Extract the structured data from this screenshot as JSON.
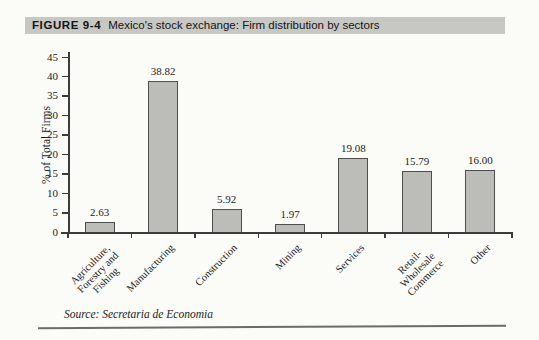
{
  "header": {
    "figure_label": "FIGURE 9-4",
    "title": "Mexico's stock exchange: Firm distribution by sectors"
  },
  "footer": {
    "source": "Source: Secretaria de Economia"
  },
  "chart_data": {
    "type": "bar",
    "title": "Mexico's stock exchange: Firm distribution by sectors",
    "categories": [
      "Agriculture,\nForestry and\nFishing",
      "Manufacturing",
      "Construction",
      "Mining",
      "Services",
      "Retail-\nWholesale\nCommerce",
      "Other"
    ],
    "values": [
      2.63,
      38.82,
      5.92,
      1.97,
      19.08,
      15.79,
      16.0
    ],
    "value_labels": [
      "2.63",
      "38.82",
      "5.92",
      "1.97",
      "19.08",
      "15.79",
      "16.00"
    ],
    "xlabel": "",
    "ylabel": "% of Total Firms",
    "ylim": [
      0,
      45
    ],
    "yticks": [
      0,
      5,
      10,
      15,
      20,
      25,
      30,
      35,
      40,
      45
    ],
    "grid": false,
    "legend": false,
    "bar_color": "#bcbcb9",
    "bar_border_color": "#4e4e4c",
    "band_color": "#c7c7c4"
  }
}
